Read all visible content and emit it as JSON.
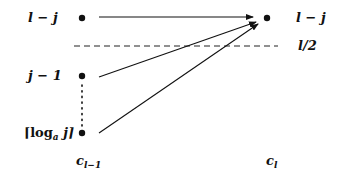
{
  "diagram": {
    "left_column": {
      "nodes": [
        {
          "label": "l − j",
          "y": 18
        },
        {
          "label": "j − 1",
          "y": 76
        },
        {
          "label_pre": "⌈log",
          "label_sub": "a",
          "label_post": " j⌉",
          "y": 133
        }
      ],
      "column_label": {
        "base": "c",
        "sub": "l−1"
      }
    },
    "right_column": {
      "nodes": [
        {
          "label": "l − j",
          "y": 18
        }
      ],
      "column_label": {
        "base": "c",
        "sub": "l"
      }
    },
    "threshold_line": {
      "label": "l/2",
      "style": "dashed",
      "y": 46
    },
    "edges": [
      {
        "from": "left.0",
        "to": "right.0"
      },
      {
        "from": "left.1",
        "to": "right.0"
      },
      {
        "from": "left.2",
        "to": "right.0"
      }
    ],
    "colors": {
      "ink": "#111111",
      "background": "#ffffff"
    }
  }
}
